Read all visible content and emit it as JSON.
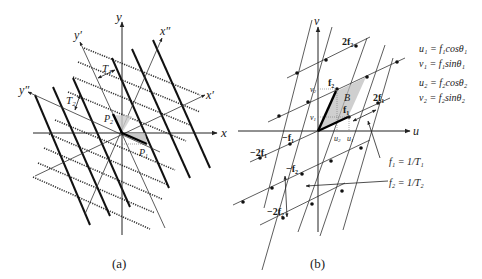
{
  "panel_a": {
    "caption": "(a)",
    "axes": {
      "x": "x",
      "y": "y",
      "x_prime": "x′",
      "y_prime": "y′",
      "x_dprime": "x″",
      "y_dprime": "y″"
    },
    "labels": {
      "T1": "T",
      "T1_sub": "1",
      "T2": "T",
      "T2_sub": "2",
      "P1": "P",
      "P1_sub": "1",
      "P2": "P",
      "P2_sub": "2"
    }
  },
  "panel_b": {
    "caption": "(b)",
    "axes": {
      "u": "u",
      "v": "v"
    },
    "labels": {
      "f1": "f",
      "f1_sub": "1",
      "f2": "f",
      "f2_sub": "2",
      "two_f1": "2f",
      "two_f2": "2f",
      "neg_f1": "−f",
      "neg_f2": "−f",
      "neg_two_f1": "−2f",
      "neg_two_f2": "−2f",
      "B": "B",
      "u1": "u",
      "u2": "u",
      "v1": "v",
      "v2": "v"
    },
    "equations": [
      "u₁ = f₁cosθ₁",
      "v₁ = f₁sinθ₁",
      "u₂ = f₂cosθ₂",
      "v₂ = f₂sinθ₂"
    ],
    "annotations": [
      "f₁ = 1/T₁",
      "f₂ = 1/T₂"
    ]
  }
}
